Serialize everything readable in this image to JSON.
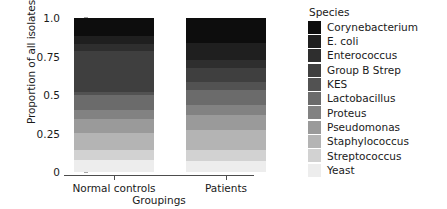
{
  "chart_data": {
    "type": "bar",
    "subtype": "stacked-proportion",
    "title": "",
    "xlabel": "Groupings",
    "ylabel": "Proportion of all isolates",
    "categories": [
      "Normal controls",
      "Patients"
    ],
    "ylim": [
      0,
      1
    ],
    "ytick_labels": [
      "0",
      "0.25",
      "0.5",
      "0.75",
      "1.0"
    ],
    "ytick_values": [
      0,
      0.25,
      0.5,
      0.75,
      1.0
    ],
    "grid": false,
    "legend_title": "Species",
    "legend_position": "right",
    "stack_order_top_to_bottom": true,
    "series": [
      {
        "name": "Corynebacterium",
        "color": "#0d0d0d",
        "values": [
          0.12,
          0.165
        ]
      },
      {
        "name": "E. coli",
        "color": "#1f1f1f",
        "values": [
          0.05,
          0.105
        ]
      },
      {
        "name": "Enterococcus",
        "color": "#2e2e2e",
        "values": [
          0.045,
          0.055
        ]
      },
      {
        "name": "Group B Strep",
        "color": "#3f3f3f",
        "values": [
          0.265,
          0.09
        ]
      },
      {
        "name": "KES",
        "color": "#525252",
        "values": [
          0.02,
          0.055
        ]
      },
      {
        "name": "Lactobacillus",
        "color": "#6b6b6b",
        "values": [
          0.1,
          0.095
        ]
      },
      {
        "name": "Proteus",
        "color": "#828282",
        "values": [
          0.055,
          0.065
        ]
      },
      {
        "name": "Pseudomonas",
        "color": "#9a9a9a",
        "values": [
          0.09,
          0.1
        ]
      },
      {
        "name": "Staphylococcus",
        "color": "#b4b4b4",
        "values": [
          0.115,
          0.125
        ]
      },
      {
        "name": "Streptococcus",
        "color": "#d2d2d2",
        "values": [
          0.065,
          0.075
        ]
      },
      {
        "name": "Yeast",
        "color": "#ededed",
        "values": [
          0.075,
          0.07
        ]
      }
    ]
  }
}
